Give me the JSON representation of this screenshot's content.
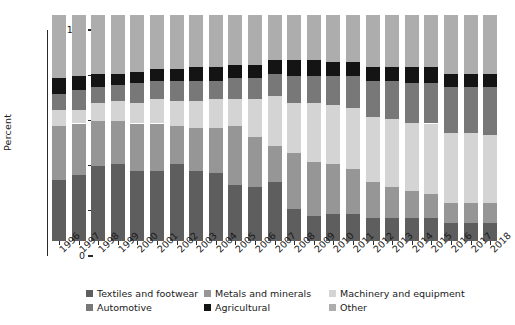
{
  "chart_data": {
    "type": "bar",
    "subtype": "stacked-bar-100",
    "title": "",
    "xlabel": "",
    "ylabel": "Percent",
    "ylim": [
      0,
      100
    ],
    "yticks": [
      0,
      20,
      40,
      60,
      80,
      100
    ],
    "grid": false,
    "legend_position": "bottom",
    "categories": [
      "1996",
      "1997",
      "1998",
      "1999",
      "2000",
      "2001",
      "2002",
      "2003",
      "2004",
      "2005",
      "2006",
      "2007",
      "2008",
      "2009",
      "2010",
      "2011",
      "2012",
      "2013",
      "2014",
      "2015",
      "2016",
      "2017",
      "2018"
    ],
    "series": [
      {
        "name": "Textiles and footwear",
        "color": "#5e5e5e",
        "values": [
          27,
          29,
          33,
          34,
          31,
          31,
          34,
          31,
          30,
          25,
          24,
          26,
          14,
          11,
          12,
          12,
          10,
          10,
          10,
          10,
          8,
          8,
          8
        ]
      },
      {
        "name": "Metals and minerals",
        "color": "#969696",
        "values": [
          24,
          23,
          20,
          19,
          21,
          21,
          17,
          19,
          20,
          26,
          22,
          16,
          25,
          24,
          22,
          20,
          16,
          14,
          12,
          11,
          9,
          9,
          9
        ]
      },
      {
        "name": "Machinery and equipment",
        "color": "#d4d4d4",
        "values": [
          7,
          6,
          8,
          9,
          9,
          11,
          11,
          12,
          13,
          12,
          17,
          22,
          22,
          26,
          26,
          27,
          29,
          30,
          30,
          31,
          31,
          31,
          30
        ]
      },
      {
        "name": "Automotive",
        "color": "#787878",
        "values": [
          7,
          9,
          7,
          7,
          9,
          8,
          9,
          9,
          8,
          9,
          9,
          10,
          12,
          12,
          13,
          14,
          16,
          17,
          18,
          18,
          20,
          20,
          21
        ]
      },
      {
        "name": "Agricultural",
        "color": "#141414",
        "values": [
          7,
          6,
          6,
          5,
          5,
          5,
          5,
          6,
          6,
          6,
          6,
          6,
          7,
          7,
          6,
          6,
          6,
          6,
          7,
          7,
          6,
          6,
          6
        ]
      },
      {
        "name": "Other",
        "color": "#adadad",
        "values": [
          28,
          27,
          26,
          26,
          25,
          24,
          24,
          23,
          23,
          22,
          22,
          20,
          20,
          20,
          21,
          21,
          23,
          23,
          23,
          23,
          26,
          26,
          26
        ]
      }
    ]
  },
  "legend": {
    "items": [
      {
        "label": "Textiles and footwear",
        "color": "#5e5e5e"
      },
      {
        "label": "Metals and minerals",
        "color": "#969696"
      },
      {
        "label": "Machinery and equipment",
        "color": "#d4d4d4"
      },
      {
        "label": "Automotive",
        "color": "#787878"
      },
      {
        "label": "Agricultural",
        "color": "#141414"
      },
      {
        "label": "Other",
        "color": "#adadad"
      }
    ]
  }
}
